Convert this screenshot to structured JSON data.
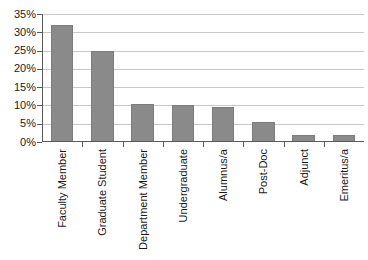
{
  "chart_data": {
    "type": "bar",
    "title": "",
    "subtitle": "",
    "xlabel": "",
    "ylabel": "",
    "categories": [
      "Faculty Member",
      "Graduate Student",
      "Department Member",
      "Undergraduate",
      "Alumnus/a",
      "Post-Doc",
      "Adjunct",
      "Emeritus/a"
    ],
    "values": [
      32,
      25,
      10.5,
      10,
      9.5,
      5.5,
      2,
      1.8
    ],
    "ylim": [
      0,
      35
    ],
    "ytick_values": [
      0,
      5,
      10,
      15,
      20,
      25,
      30,
      35
    ],
    "ytick_labels": [
      "0%",
      "5%",
      "10%",
      "15%",
      "20%",
      "25%",
      "30%",
      "35%"
    ],
    "grid": true,
    "legend": false,
    "legend_position": "none",
    "bar_color": "#8a8a8a",
    "gridline_color": "#c8c8c8",
    "axis_color": "#5a5a5a",
    "background_color": "#ffffff"
  }
}
